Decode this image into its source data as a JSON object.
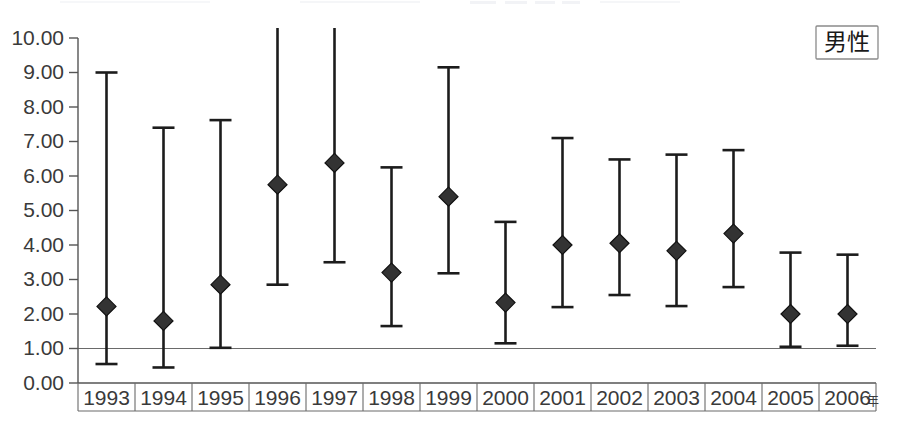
{
  "legend": {
    "label": "男性",
    "meaning": "male"
  },
  "axes": {
    "y_tick_labels": [
      "10.00",
      "9.00",
      "8.00",
      "7.00",
      "6.00",
      "5.00",
      "4.00",
      "3.00",
      "2.00",
      "1.00",
      "0.00"
    ],
    "x_tick_labels": [
      "1993",
      "1994",
      "1995",
      "1996",
      "1997",
      "1998",
      "1999",
      "2000",
      "2001",
      "2002",
      "2003",
      "2004",
      "2005",
      "2006"
    ],
    "x_unit_label": "年",
    "reference_line_value": "1.00"
  },
  "chart_data": {
    "type": "scatter",
    "title": "",
    "subtitle": "",
    "xlabel": "年",
    "ylabel": "",
    "ylim": [
      0.0,
      10.0
    ],
    "ytick_step": 1.0,
    "grid": false,
    "legend_position": "top-right",
    "legend_entries": [
      "男性"
    ],
    "reference_lines": [
      {
        "y": 1.0,
        "label": "1.00"
      }
    ],
    "categories": [
      "1993",
      "1994",
      "1995",
      "1996",
      "1997",
      "1998",
      "1999",
      "2000",
      "2001",
      "2002",
      "2003",
      "2004",
      "2005",
      "2006"
    ],
    "values": [
      2.22,
      1.8,
      2.85,
      5.75,
      6.38,
      3.2,
      5.4,
      2.33,
      4.0,
      4.05,
      3.83,
      4.33,
      2.0,
      2.0
    ],
    "error_low": [
      0.55,
      0.45,
      1.02,
      2.85,
      3.5,
      1.65,
      3.18,
      1.15,
      2.2,
      2.55,
      2.23,
      2.78,
      1.05,
      1.08
    ],
    "error_high": [
      9.0,
      7.4,
      7.62,
      10.45,
      10.45,
      6.25,
      9.15,
      4.67,
      7.1,
      6.48,
      6.62,
      6.75,
      3.78,
      3.72
    ],
    "clipped_high": [
      false,
      false,
      false,
      true,
      true,
      false,
      false,
      false,
      false,
      false,
      false,
      false,
      false,
      false
    ],
    "series": [
      {
        "name": "男性",
        "points": [
          {
            "x": "1993",
            "value": 2.22,
            "low": 0.55,
            "high": 9.0
          },
          {
            "x": "1994",
            "value": 1.8,
            "low": 0.45,
            "high": 7.4
          },
          {
            "x": "1995",
            "value": 2.85,
            "low": 1.02,
            "high": 7.62
          },
          {
            "x": "1996",
            "value": 5.75,
            "low": 2.85,
            "high": 10.45
          },
          {
            "x": "1997",
            "value": 6.38,
            "low": 3.5,
            "high": 10.45
          },
          {
            "x": "1998",
            "value": 3.2,
            "low": 1.65,
            "high": 6.25
          },
          {
            "x": "1999",
            "value": 5.4,
            "low": 3.18,
            "high": 9.15
          },
          {
            "x": "2000",
            "value": 2.33,
            "low": 1.15,
            "high": 4.67
          },
          {
            "x": "2001",
            "value": 4.0,
            "low": 2.2,
            "high": 7.1
          },
          {
            "x": "2002",
            "value": 4.05,
            "low": 2.55,
            "high": 6.48
          },
          {
            "x": "2003",
            "value": 3.83,
            "low": 2.23,
            "high": 6.62
          },
          {
            "x": "2004",
            "value": 4.33,
            "low": 2.78,
            "high": 6.75
          },
          {
            "x": "2005",
            "value": 2.0,
            "low": 1.05,
            "high": 3.78
          },
          {
            "x": "2006",
            "value": 2.0,
            "low": 1.08,
            "high": 3.72
          }
        ]
      }
    ]
  },
  "colors": {
    "marker": "#333333",
    "whisker": "#1c1c1c",
    "axis": "#555555",
    "text": "#3a3a3a",
    "background": "#ffffff"
  }
}
